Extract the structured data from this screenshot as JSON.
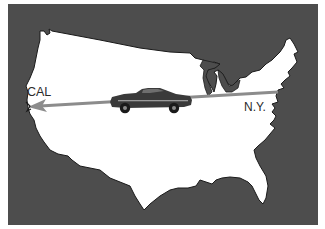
{
  "figure": {
    "colors": {
      "background_panel": "#4d4d4d",
      "map_fill": "#ffffff",
      "map_outline": "#1a1a1a",
      "arrow": "#8c8c8c",
      "car_body": "#3a3a3a",
      "label_text": "#2a2a2a",
      "frame": "#ffffff"
    },
    "labels": {
      "origin": "N.Y.",
      "destination": "CAL"
    },
    "arrow": {
      "from": "N.Y.",
      "to": "CAL",
      "direction": "west"
    },
    "icons": {
      "vehicle": "car-icon",
      "map": "usa-map-icon",
      "arrow": "arrow-left-icon"
    }
  }
}
